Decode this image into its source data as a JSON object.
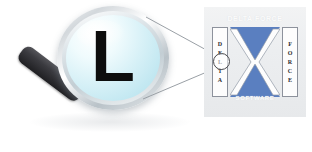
{
  "scene": {
    "width": 312,
    "height": 152,
    "background_color": "#ffffff",
    "description": "Magnifying glass showing letter L, with callout lines to a Delta Force logo panel"
  },
  "magnifier": {
    "lens_letter": "L",
    "lens_tint_color": "#c8eaf2",
    "ring_color": "#d3d8dc",
    "handle_color": "#2c2c30",
    "letter_color": "#0d0d0d"
  },
  "callouts": {
    "line_color": "#9aa0a6",
    "count": 2
  },
  "logo_panel": {
    "background_color": "#eceef0",
    "top_text": "DELTA FORCE",
    "bottom_text": "SOFTWARE",
    "left_letters": [
      "D",
      "E",
      "L",
      "T",
      "A"
    ],
    "right_letters": [
      "F",
      "O",
      "R",
      "C",
      "E"
    ],
    "emblem_color": "#5a7fc0",
    "emblem_shape": "hourglass",
    "highlighted_letter": "L"
  }
}
